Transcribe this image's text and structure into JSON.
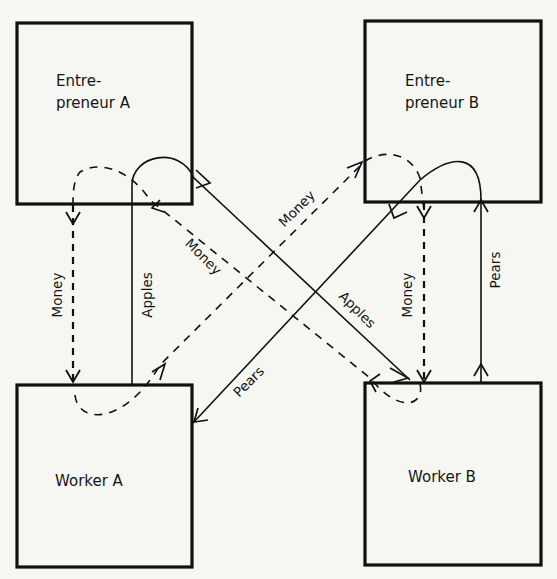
{
  "diagram": {
    "nodes": {
      "entrepreneur_a": {
        "line1": "Entre-",
        "line2": "preneur A"
      },
      "entrepreneur_b": {
        "line1": "Entre-",
        "line2": "preneur B"
      },
      "worker_a": {
        "label": "Worker A"
      },
      "worker_b": {
        "label": "Worker B"
      }
    },
    "flows": {
      "money_ea_to_wa": {
        "label": "Money",
        "style": "dashed",
        "from": "Entrepreneur A",
        "to": "Worker A"
      },
      "apples_wa_to_ea": {
        "label": "Apples",
        "style": "solid",
        "from": "Worker A",
        "to": "Entrepreneur A"
      },
      "apples_ea_to_wb": {
        "label": "Apples",
        "style": "solid",
        "from": "Entrepreneur A",
        "to": "Worker B"
      },
      "money_wb_to_ea": {
        "label": "Money",
        "style": "dashed",
        "from": "Worker B",
        "to": "Entrepreneur A"
      },
      "money_wa_to_eb": {
        "label": "Money",
        "style": "dashed",
        "from": "Worker A",
        "to": "Entrepreneur B"
      },
      "pears_eb_to_wa": {
        "label": "Pears",
        "style": "solid",
        "from": "Entrepreneur B",
        "to": "Worker A"
      },
      "money_eb_to_wb": {
        "label": "Money",
        "style": "dashed",
        "from": "Entrepreneur B",
        "to": "Worker B"
      },
      "pears_wb_to_eb": {
        "label": "Pears",
        "style": "solid",
        "from": "Worker B",
        "to": "Entrepreneur B"
      }
    }
  }
}
